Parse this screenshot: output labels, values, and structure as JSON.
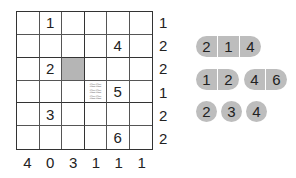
{
  "grid": {
    "size": 6,
    "cells": [
      [
        "",
        "1",
        "",
        "",
        "",
        ""
      ],
      [
        "",
        "",
        "",
        "",
        "4",
        ""
      ],
      [
        "",
        "2",
        "",
        "",
        "",
        ""
      ],
      [
        "",
        "",
        "",
        "",
        "5",
        ""
      ],
      [
        "",
        "3",
        "",
        "",
        "",
        ""
      ],
      [
        "",
        "",
        "",
        "",
        "6",
        ""
      ]
    ],
    "shaded_cell": {
      "row": 2,
      "col": 2
    },
    "water_cell": {
      "row": 3,
      "col": 3
    }
  },
  "row_clues": [
    "1",
    "2",
    "2",
    "1",
    "2",
    "2"
  ],
  "col_clues": [
    "4",
    "0",
    "3",
    "1",
    "1",
    "1"
  ],
  "fleet": {
    "ships": [
      {
        "length": 3,
        "segments": [
          "2",
          "1",
          "4"
        ]
      },
      {
        "length": 2,
        "segments": [
          "1",
          "2"
        ]
      },
      {
        "length": 2,
        "segments": [
          "4",
          "6"
        ]
      },
      {
        "length": 1,
        "segments": [
          "2"
        ]
      },
      {
        "length": 1,
        "segments": [
          "3"
        ]
      },
      {
        "length": 1,
        "segments": [
          "4"
        ]
      }
    ]
  },
  "colors": {
    "ship": "#bdbdbd",
    "shaded_cell": "#b5b5b5",
    "grid_line": "#333333"
  }
}
